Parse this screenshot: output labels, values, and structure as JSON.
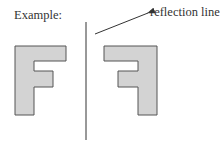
{
  "diagram": {
    "example_label": "Example:",
    "reflection_label": "reflection line",
    "colors": {
      "shape_fill": "#d3d3d3",
      "shape_stroke": "#555555",
      "line": "#333333",
      "text": "#333333"
    },
    "shapes": [
      {
        "name": "original-letter-f",
        "description": "letter F"
      },
      {
        "name": "reflected-letter-f",
        "description": "mirror image of letter F"
      }
    ]
  }
}
